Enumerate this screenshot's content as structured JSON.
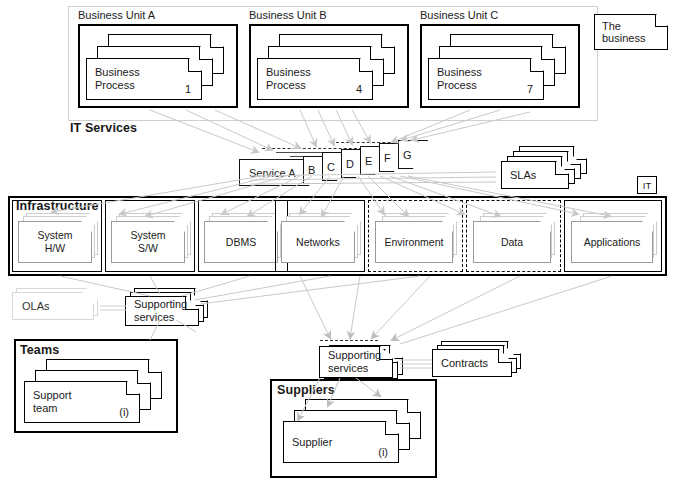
{
  "business_band": {
    "label": "The business",
    "units": [
      {
        "title": "Business Unit A",
        "process_label": "Business\nProcess",
        "numbers": [
          "1",
          "2",
          "3"
        ]
      },
      {
        "title": "Business Unit B",
        "process_label": "Business\nProcess",
        "numbers": [
          "4",
          "5",
          "6"
        ]
      },
      {
        "title": "Business Unit C",
        "process_label": "Business\nProcess",
        "numbers": [
          "7",
          "8",
          "9"
        ]
      }
    ]
  },
  "it_services": {
    "section_label": "IT Services",
    "primary_service": "Service A",
    "other_services": [
      "B",
      "C",
      "D",
      "E",
      "F",
      "G"
    ],
    "slas_label": "SLAs",
    "it_tag": "IT"
  },
  "infrastructure": {
    "section_label": "Infrastructure",
    "items": [
      {
        "label": "System\nH/W",
        "dashed": false
      },
      {
        "label": "System\nS/W",
        "dashed": false
      },
      {
        "label": "DBMS",
        "dashed": false
      },
      {
        "label": "Networks",
        "dashed": false
      },
      {
        "label": "Environment",
        "dashed": true
      },
      {
        "label": "Data",
        "dashed": true
      },
      {
        "label": "Applications",
        "dashed": false
      }
    ]
  },
  "internal_support": {
    "olas_label": "OLAs",
    "supporting_services_label": "Supporting\nservices",
    "teams": {
      "section_label": "Teams",
      "entity_label": "Support\nteam",
      "numbers": [
        "(i)",
        "(ii)",
        "(iii)"
      ]
    }
  },
  "external_support": {
    "supporting_services_label": "Supporting\nservices",
    "contracts_label": "Contracts",
    "suppliers": {
      "section_label": "Suppliers",
      "entity_label": "Supplier",
      "numbers": [
        "(i)",
        "(ii)",
        "(iii)"
      ]
    }
  },
  "colors": {
    "ink": "#000000",
    "wire": "#c9c9c9",
    "ghost": "#d8d8d8",
    "soft_frame": "#cfcfcf"
  }
}
